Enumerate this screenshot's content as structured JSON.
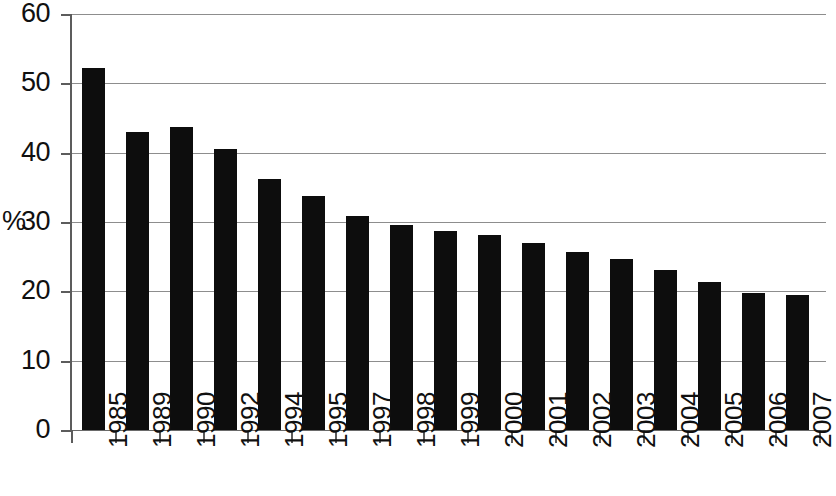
{
  "chart_data": {
    "type": "bar",
    "title": "",
    "subtitle": "",
    "xlabel": "",
    "ylabel": "%",
    "ylim": [
      0,
      60
    ],
    "ytick_labels": [
      "60",
      "50",
      "40",
      "30",
      "20",
      "10",
      "0"
    ],
    "yticks": [
      60,
      50,
      40,
      30,
      20,
      10,
      0
    ],
    "grid": true,
    "legend": "none",
    "bar_color": "#0d0d0d",
    "grid_color": "#8d8d8d",
    "axis_color": "#5c5c5c",
    "categories": [
      "1985",
      "1989",
      "1990",
      "1992",
      "1994",
      "1995",
      "1997",
      "1998",
      "1999",
      "2000",
      "2001",
      "2002",
      "2003",
      "2004",
      "2005",
      "2006",
      "2007"
    ],
    "values": [
      52.2,
      43.0,
      43.7,
      40.5,
      36.2,
      33.8,
      30.8,
      29.6,
      28.7,
      28.1,
      27.0,
      25.7,
      24.7,
      23.1,
      21.4,
      19.8,
      19.5
    ]
  }
}
